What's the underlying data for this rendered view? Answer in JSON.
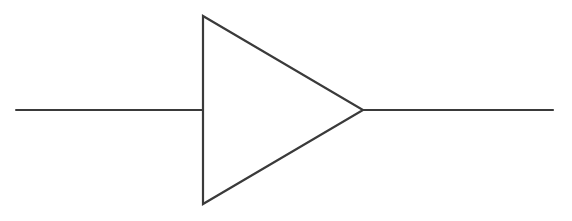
{
  "diagram": {
    "type": "buffer-amplifier-symbol",
    "stroke_color": "#3a3a3a",
    "background": "#ffffff",
    "input_line": {
      "x1": 16,
      "y1": 110,
      "x2": 203,
      "y2": 110
    },
    "triangle": {
      "left_x": 203,
      "top_y": 16,
      "bottom_y": 204,
      "apex_x": 363,
      "apex_y": 110
    },
    "output_line": {
      "x1": 363,
      "y1": 110,
      "x2": 553,
      "y2": 110
    }
  }
}
